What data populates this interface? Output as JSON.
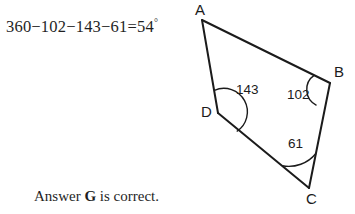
{
  "work": {
    "equation_text": "360−102−143−61=54",
    "equation_degree": "°",
    "equation_plain": "360−102−143−61=54°"
  },
  "conclusion": {
    "prefix": "Answer ",
    "choice": "G",
    "suffix": " is correct."
  },
  "figure": {
    "shape": "quadrilateral",
    "stroke_color": "#1b1b1b",
    "fill_color": "none",
    "vertices": [
      {
        "name": "A",
        "label": "A",
        "x": 202,
        "y": 20,
        "label_x": 195,
        "label_y": 2
      },
      {
        "name": "B",
        "label": "B",
        "x": 330,
        "y": 83,
        "label_x": 334,
        "label_y": 64
      },
      {
        "name": "C",
        "label": "C",
        "x": 309,
        "y": 188,
        "label_x": 306,
        "label_y": 191
      },
      {
        "name": "D",
        "label": "D",
        "x": 218,
        "y": 113,
        "label_x": 201,
        "label_y": 104
      }
    ],
    "angle_marks": [
      {
        "at": "D",
        "value": "143",
        "label_x": 236,
        "label_y": 83
      },
      {
        "at": "B",
        "value": "102",
        "label_x": 287,
        "label_y": 88
      },
      {
        "at": "C",
        "value": "61",
        "label_x": 288,
        "label_y": 137
      }
    ]
  }
}
